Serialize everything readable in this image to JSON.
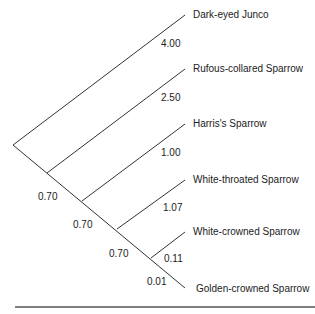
{
  "tree": {
    "taxa": [
      {
        "name": "Dark-eyed Junco",
        "branch_length": "4.00"
      },
      {
        "name": "Rufous-collared Sparrow",
        "branch_length": "2.50"
      },
      {
        "name": "Harris's Sparrow",
        "branch_length": "1.00"
      },
      {
        "name": "White-throated Sparrow",
        "branch_length": "1.07"
      },
      {
        "name": "White-crowned Sparrow",
        "branch_length": "0.11"
      },
      {
        "name": "Golden-crowned Sparrow",
        "branch_length": "0.01"
      }
    ],
    "internal_branches": [
      "0.70",
      "0.70",
      "0.70"
    ],
    "line_color": "#333333"
  }
}
